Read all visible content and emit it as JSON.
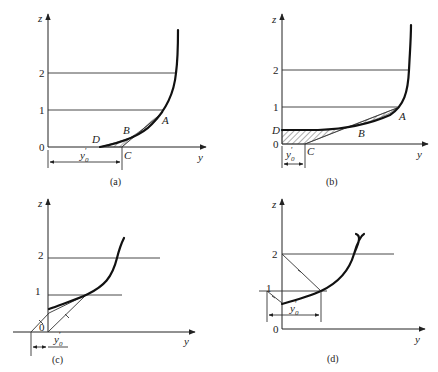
{
  "panels": [
    {
      "id": "a",
      "caption": "(a)",
      "axis_z": "z",
      "axis_y": "y",
      "ticks": [
        "0",
        "1",
        "2"
      ],
      "points": {
        "A": "A",
        "B": "B",
        "C": "C",
        "D": "D"
      },
      "dimension_label": "y0'",
      "dimension_base": "y",
      "dimension_sub": "0",
      "dimension_prime": "′"
    },
    {
      "id": "b",
      "caption": "(b)",
      "axis_z": "z",
      "axis_y": "y",
      "ticks": [
        "0",
        "1",
        "2"
      ],
      "points": {
        "A": "A",
        "B": "B",
        "C": "C",
        "D": "D"
      },
      "dimension_base": "y",
      "dimension_sub": "0",
      "dimension_prime": "′"
    },
    {
      "id": "c",
      "caption": "(c)",
      "axis_z": "z",
      "axis_y": "y",
      "ticks": [
        "0",
        "1",
        "2"
      ],
      "dimension_base": "y",
      "dimension_sub": "0",
      "dimension_prime": "′"
    },
    {
      "id": "d",
      "caption": "(d)",
      "axis_z": "z",
      "axis_y": "y",
      "ticks": [
        "0",
        "1",
        "2"
      ],
      "dimension_base": "y",
      "dimension_sub": "0",
      "dimension_prime": "′"
    }
  ]
}
